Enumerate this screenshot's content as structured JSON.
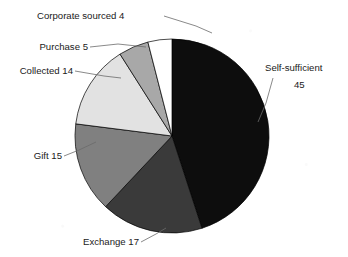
{
  "chart_data": {
    "type": "pie",
    "title": "",
    "subtitle": "",
    "xlabel": "",
    "ylabel": "",
    "legend_position": "none",
    "grid": false,
    "total": 100,
    "start_angle_deg": 0,
    "direction": "clockwise",
    "categories": [
      "Self-sufficient",
      "Exchange",
      "Gift",
      "Collected",
      "Purchase",
      "Corporate sourced"
    ],
    "values": [
      45,
      17,
      15,
      14,
      5,
      4
    ],
    "colors": [
      "#0d0d0d",
      "#3a3a3a",
      "#808080",
      "#e2e2e2",
      "#a8a8a8",
      "#ffffff"
    ],
    "slices": [
      {
        "label": "Self-sufficient",
        "value": 45,
        "color": "#0d0d0d",
        "label_line1": "Self-sufficient",
        "label_line2": "45",
        "label_text": "Self-sufficient 45"
      },
      {
        "label": "Exchange",
        "value": 17,
        "color": "#3a3a3a",
        "label_line1": "Exchange 17",
        "label_line2": "",
        "label_text": "Exchange 17"
      },
      {
        "label": "Gift",
        "value": 15,
        "color": "#808080",
        "label_line1": "Gift 15",
        "label_line2": "",
        "label_text": "Gift 15"
      },
      {
        "label": "Collected",
        "value": 14,
        "color": "#e2e2e2",
        "label_line1": "Collected 14",
        "label_line2": "",
        "label_text": "Collected 14"
      },
      {
        "label": "Purchase",
        "value": 5,
        "color": "#a8a8a8",
        "label_line1": "Purchase 5",
        "label_line2": "",
        "label_text": "Purchase 5"
      },
      {
        "label": "Corporate sourced",
        "value": 4,
        "color": "#ffffff",
        "label_line1": "Corporate sourced  4",
        "label_line2": "",
        "label_text": "Corporate sourced 4"
      }
    ]
  },
  "geometry": {
    "cx": 172,
    "cy": 136,
    "r": 97
  },
  "style": {
    "background": "#ffffff",
    "outline": "#000000",
    "leader_line": "#6b6b6b",
    "text": "#1a1a1a"
  }
}
